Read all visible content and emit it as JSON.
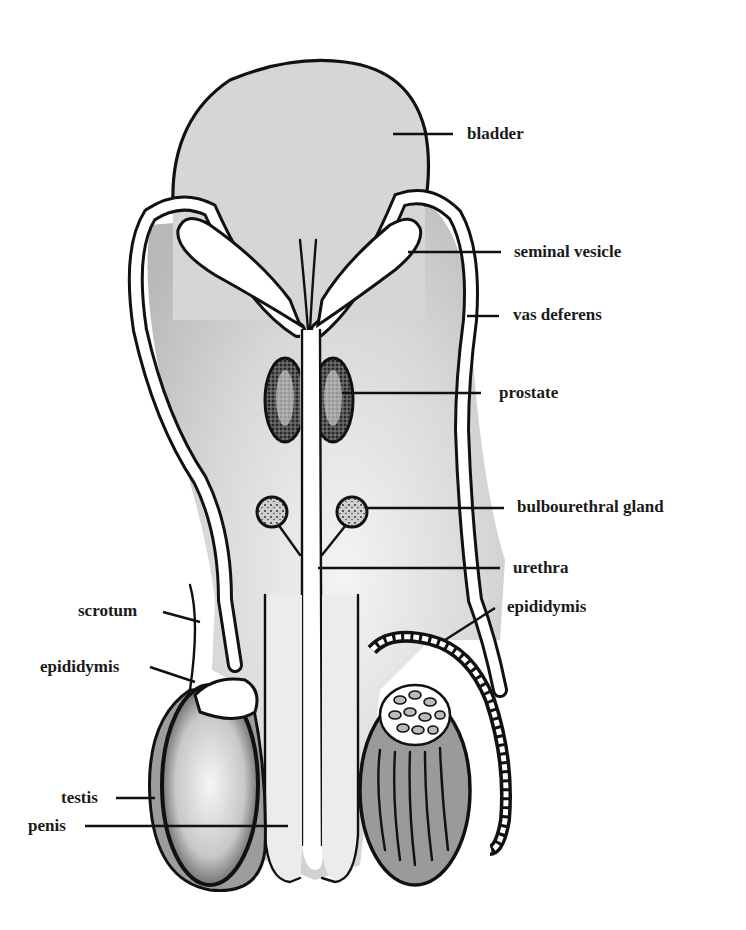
{
  "diagram": {
    "colors": {
      "background": "#ffffff",
      "tissue_light": "#d6d6d6",
      "tissue_medium": "#c4c4c4",
      "tissue_dark": "#9a9a9a",
      "tube_fill": "#ffffff",
      "outline": "#111111",
      "label_text": "#1a1a1a"
    },
    "labels": {
      "bladder": "bladder",
      "seminal_vesicle": "seminal vesicle",
      "vas_deferens": "vas deferens",
      "prostate": "prostate",
      "bulbourethral_gland": "bulbourethral gland",
      "urethra": "urethra",
      "epididymis_right": "epididymis",
      "scrotum": "scrotum",
      "epididymis_left": "epididymis",
      "testis": "testis",
      "penis": "penis"
    }
  }
}
